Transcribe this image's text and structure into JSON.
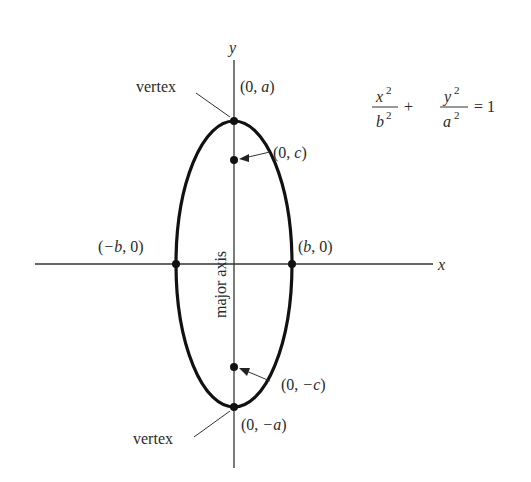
{
  "diagram": {
    "equation": {
      "term1_num": "x",
      "term1_num_exp": "2",
      "term1_den": "b",
      "term1_den_exp": "2",
      "plus": "+",
      "term2_num": "y",
      "term2_num_exp": "2",
      "term2_den": "a",
      "term2_den_exp": "2",
      "equals": "= 1"
    },
    "axes": {
      "x_label": "x",
      "y_label": "y"
    },
    "points": {
      "top_vertex": {
        "open": "(0, ",
        "var": "a",
        "close": ")"
      },
      "bottom_vertex": {
        "open": "(0, ",
        "var": "−a",
        "close": ")"
      },
      "focus_top": {
        "open": "(0, ",
        "var": "c",
        "close": ")"
      },
      "focus_bottom": {
        "open": "(0, ",
        "var": "−c",
        "close": ")"
      },
      "left_covertex": {
        "open": "(",
        "var": "−b",
        "close": ", 0)"
      },
      "right_covertex": {
        "open": "(",
        "var": "b",
        "close": ", 0)"
      }
    },
    "annotations": {
      "vertex_top": "vertex",
      "vertex_bottom": "vertex",
      "major_axis": "major axis"
    },
    "colors": {
      "curve": "#111111",
      "axis": "#333333",
      "text": "#2a2a2a"
    }
  }
}
